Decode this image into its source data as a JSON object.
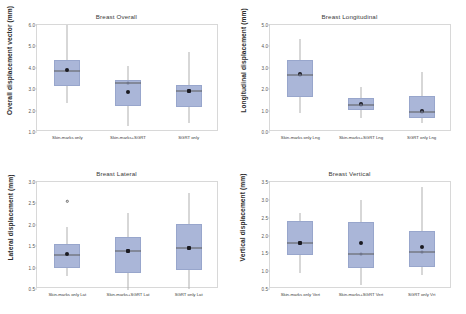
{
  "figure": {
    "background": "#ffffff",
    "box_fill": "#aab6d8",
    "box_edge": "#98a6cc",
    "whisker_color": "#b0b0b0",
    "frame_color": "#d8d8d8"
  },
  "chart_data": [
    {
      "id": "breast-overall",
      "type": "box",
      "title": "Breast Overall",
      "xlabel": "",
      "ylabel": "Overall displacement vector (mm)",
      "ylim": [
        1.0,
        6.0
      ],
      "yticks": [
        "6.0",
        "5.0",
        "4.0",
        "3.0",
        "2.0",
        "1.0"
      ],
      "ytick_values": [
        6.0,
        5.0,
        4.0,
        3.0,
        2.0,
        1.0
      ],
      "grid": false,
      "legend": "none",
      "categories": [
        "Skin-marks only",
        "Skin-marks+SGRT",
        "SGRT only"
      ],
      "boxes": [
        {
          "category": "Skin-marks only",
          "whisker_low": 2.35,
          "q1": 3.15,
          "median": 3.85,
          "q3": 4.35,
          "whisker_high": 6.0,
          "mean": 3.9,
          "outliers": []
        },
        {
          "category": "Skin-marks+SGRT",
          "whisker_low": 1.3,
          "q1": 2.2,
          "median": 3.3,
          "q3": 3.45,
          "whisker_high": 4.1,
          "mean": 2.85,
          "outliers": []
        },
        {
          "category": "SGRT only",
          "whisker_low": 1.4,
          "q1": 2.15,
          "median": 2.9,
          "q3": 3.2,
          "whisker_high": 4.75,
          "mean": 2.9,
          "outliers": []
        }
      ]
    },
    {
      "id": "breast-longitudinal",
      "type": "box",
      "title": "Breast Longitudinal",
      "xlabel": "",
      "ylabel": "Longitudinal displacement (mm)",
      "ylim": [
        0.0,
        5.0
      ],
      "yticks": [
        "5.0",
        "4.0",
        "3.0",
        "2.0",
        "1.0",
        "0.0"
      ],
      "ytick_values": [
        5.0,
        4.0,
        3.0,
        2.0,
        1.0,
        0.0
      ],
      "grid": false,
      "legend": "none",
      "categories": [
        "Skin-marks only Lng",
        "Skin-marks+SGRT Lng",
        "SGRT only Lng"
      ],
      "boxes": [
        {
          "category": "Skin-marks only Lng",
          "whisker_low": 0.9,
          "q1": 1.65,
          "median": 2.65,
          "q3": 3.35,
          "whisker_high": 4.35,
          "mean": 2.7,
          "outliers": []
        },
        {
          "category": "Skin-marks+SGRT Lng",
          "whisker_low": 0.65,
          "q1": 1.05,
          "median": 1.25,
          "q3": 1.6,
          "whisker_high": 2.1,
          "mean": 1.3,
          "outliers": []
        },
        {
          "category": "SGRT only Lng",
          "whisker_low": 0.4,
          "q1": 0.65,
          "median": 0.95,
          "q3": 1.7,
          "whisker_high": 2.8,
          "mean": 1.0,
          "outliers": []
        }
      ]
    },
    {
      "id": "breast-lateral",
      "type": "box",
      "title": "Breast Lateral",
      "xlabel": "",
      "ylabel": "Lateral displacement (mm)",
      "ylim": [
        0.5,
        3.0
      ],
      "yticks": [
        "3.0",
        "2.5",
        "2.0",
        "1.5",
        "1.0",
        "0.5"
      ],
      "ytick_values": [
        3.0,
        2.5,
        2.0,
        1.5,
        1.0,
        0.5
      ],
      "grid": false,
      "legend": "none",
      "categories": [
        "Skin-marks only Lat",
        "Skin-marks+SGRT Lat",
        "SGRT only Lat"
      ],
      "boxes": [
        {
          "category": "Skin-marks only Lat",
          "whisker_low": 0.8,
          "q1": 0.98,
          "median": 1.3,
          "q3": 1.55,
          "whisker_high": 1.95,
          "mean": 1.32,
          "outliers": [
            2.55
          ]
        },
        {
          "category": "Skin-marks+SGRT Lat",
          "whisker_low": 0.48,
          "q1": 0.87,
          "median": 1.38,
          "q3": 1.72,
          "whisker_high": 2.27,
          "mean": 1.38,
          "outliers": []
        },
        {
          "category": "SGRT only Lat",
          "whisker_low": 0.5,
          "q1": 0.95,
          "median": 1.45,
          "q3": 2.02,
          "whisker_high": 2.75,
          "mean": 1.45,
          "outliers": []
        }
      ]
    },
    {
      "id": "breast-vertical",
      "type": "box",
      "title": "Breast Vertical",
      "xlabel": "",
      "ylabel": "Vertical displacement (mm)",
      "ylim": [
        0.5,
        3.5
      ],
      "yticks": [
        "3.5",
        "3.0",
        "2.5",
        "2.0",
        "1.5",
        "1.0",
        "0.5"
      ],
      "ytick_values": [
        3.5,
        3.0,
        2.5,
        2.0,
        1.5,
        1.0,
        0.5
      ],
      "grid": false,
      "legend": "none",
      "categories": [
        "Skin-marks only Vert",
        "Skin-marks+SGRT Vert",
        "SGRT only Vrt"
      ],
      "boxes": [
        {
          "category": "Skin-marks only Vert",
          "whisker_low": 0.95,
          "q1": 1.45,
          "median": 1.78,
          "q3": 2.42,
          "whisker_high": 2.62,
          "mean": 1.78,
          "outliers": []
        },
        {
          "category": "Skin-marks+SGRT Vert",
          "whisker_low": 0.62,
          "q1": 1.1,
          "median": 1.48,
          "q3": 2.38,
          "whisker_high": 3.0,
          "mean": 1.78,
          "outliers": []
        },
        {
          "category": "SGRT only Vrt",
          "whisker_low": 0.9,
          "q1": 1.12,
          "median": 1.55,
          "q3": 2.12,
          "whisker_high": 3.35,
          "mean": 1.68,
          "outliers": []
        }
      ]
    }
  ]
}
